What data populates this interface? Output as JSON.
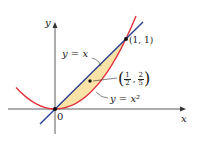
{
  "diagram": {
    "axes": {
      "x_label": "x",
      "y_label": "y",
      "origin_label": "0"
    },
    "curves": [
      {
        "name": "line",
        "label": "y = x",
        "color": "#2a3f8f"
      },
      {
        "name": "parabola",
        "label": "y = x²",
        "color": "#e0303a"
      }
    ],
    "region_fill": "#fbe3a8",
    "points": [
      {
        "label": "(1, 1)"
      },
      {
        "label": "(1/2, 2/5)",
        "numerator_x": "1",
        "denominator_x": "2",
        "numerator_y": "2",
        "denominator_y": "5"
      }
    ]
  }
}
